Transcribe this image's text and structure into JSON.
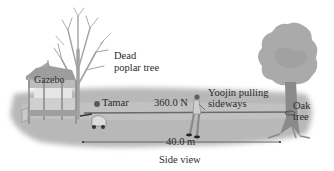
{
  "labels": {
    "gazebo": "Gazebo",
    "dead_tree_line1": "Dead",
    "dead_tree_line2": "poplar tree",
    "tamar": "Tamar",
    "force": "360.0 N",
    "yoojin_line1": "Yoojin pulling",
    "yoojin_line2": "sideways",
    "oak_line1": "Oak",
    "oak_line2": "tree",
    "distance": "40.0 m",
    "view": "Side view"
  },
  "colors": {
    "ground": "#b9b9b9",
    "ground_shadow": "#9a9a9a",
    "tree_dead": "#a8a8a8",
    "oak_foliage": "#a9a9a9",
    "oak_trunk": "#8c8c8c",
    "rope": "#6e6e6e",
    "text": "#2a2a2a"
  },
  "measurements": {
    "force_value": 360.0,
    "force_unit": "N",
    "distance_value": 40.0,
    "distance_unit": "m"
  }
}
